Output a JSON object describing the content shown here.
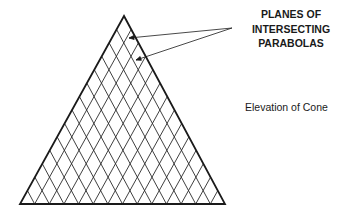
{
  "diagram": {
    "title": "Elevation of Cone",
    "callout": {
      "lines": [
        "PLANES OF",
        "INTERSECTING",
        "PARABOLAS"
      ]
    },
    "shape": {
      "type": "triangle",
      "apex": [
        124,
        16
      ],
      "base_left": [
        20,
        204
      ],
      "base_right": [
        225,
        204
      ],
      "grid_divisions": 14,
      "stroke_color": "#1a1a1a"
    },
    "arrows": [
      {
        "from": [
          232,
          28
        ],
        "to": [
          129,
          38
        ]
      },
      {
        "from": [
          232,
          28
        ],
        "to": [
          136,
          60
        ]
      }
    ]
  }
}
